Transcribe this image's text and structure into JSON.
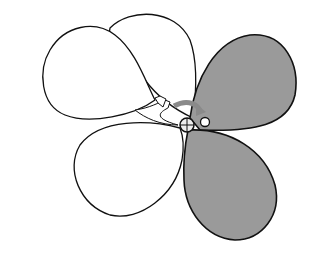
{
  "figure": {
    "colors": {
      "background": "#ffffff",
      "outline": "#111111",
      "shaded_fill": "#9a9a9a",
      "arrow": "#8a8a8a"
    },
    "balloons": [
      {
        "name": "upper-left-balloon",
        "shaded": false
      },
      {
        "name": "back-upper-balloon",
        "shaded": false
      },
      {
        "name": "lower-left-balloon",
        "shaded": false
      },
      {
        "name": "upper-right-balloon",
        "shaded": true
      },
      {
        "name": "lower-right-balloon",
        "shaded": true
      }
    ]
  }
}
